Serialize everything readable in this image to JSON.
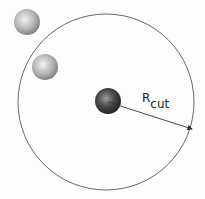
{
  "diagram": {
    "title": "",
    "cutoff_label": {
      "main": "R",
      "subscript": "cut"
    },
    "cutoff_circle": {
      "cx": 106,
      "cy": 102,
      "r": 88,
      "stroke": "#555555"
    },
    "central_particle": {
      "cx": 108,
      "cy": 101,
      "r": 13,
      "color": "#3a3a3a"
    },
    "neighbor_particles": [
      {
        "cx": 27,
        "cy": 22,
        "r": 13,
        "color": "#9a9a9a",
        "inside_cutoff": false
      },
      {
        "cx": 45,
        "cy": 67,
        "r": 13,
        "color": "#9a9a9a",
        "inside_cutoff": true
      }
    ],
    "arrow": {
      "x1": 108,
      "y1": 102,
      "x2": 193,
      "y2": 129
    }
  }
}
